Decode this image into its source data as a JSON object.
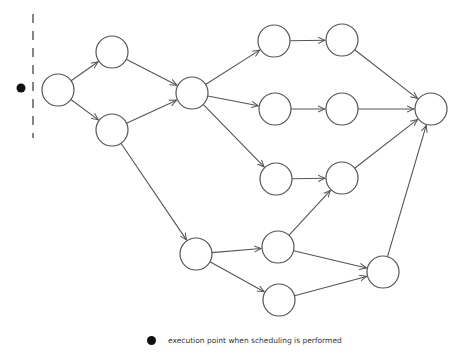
{
  "diagram": {
    "type": "directed-graph",
    "node_radius": 16,
    "nodes": [
      {
        "id": "A",
        "x": 58,
        "y": 90
      },
      {
        "id": "B",
        "x": 112,
        "y": 52
      },
      {
        "id": "C",
        "x": 112,
        "y": 130
      },
      {
        "id": "D",
        "x": 192,
        "y": 93
      },
      {
        "id": "E",
        "x": 274,
        "y": 41
      },
      {
        "id": "F",
        "x": 342,
        "y": 40
      },
      {
        "id": "G",
        "x": 275,
        "y": 109
      },
      {
        "id": "H",
        "x": 342,
        "y": 109
      },
      {
        "id": "I",
        "x": 276,
        "y": 179
      },
      {
        "id": "J",
        "x": 342,
        "y": 178
      },
      {
        "id": "K",
        "x": 431,
        "y": 109
      },
      {
        "id": "L",
        "x": 196,
        "y": 254
      },
      {
        "id": "M",
        "x": 278,
        "y": 247
      },
      {
        "id": "N",
        "x": 279,
        "y": 300
      },
      {
        "id": "O",
        "x": 383,
        "y": 272
      }
    ],
    "edges": [
      [
        "A",
        "B"
      ],
      [
        "A",
        "C"
      ],
      [
        "B",
        "D"
      ],
      [
        "C",
        "D"
      ],
      [
        "C",
        "L"
      ],
      [
        "D",
        "E"
      ],
      [
        "D",
        "G"
      ],
      [
        "D",
        "I"
      ],
      [
        "E",
        "F"
      ],
      [
        "G",
        "H"
      ],
      [
        "I",
        "J"
      ],
      [
        "F",
        "K"
      ],
      [
        "H",
        "K"
      ],
      [
        "J",
        "K"
      ],
      [
        "L",
        "M"
      ],
      [
        "L",
        "N"
      ],
      [
        "M",
        "J"
      ],
      [
        "M",
        "O"
      ],
      [
        "N",
        "O"
      ],
      [
        "O",
        "K"
      ]
    ],
    "scheduling_marker": {
      "x": 21,
      "y": 88
    },
    "divider_line": {
      "x": 33,
      "y1": 14,
      "y2": 138
    }
  },
  "legend": {
    "symbol": "filled-black-circle",
    "label": "execution point when scheduling is performed"
  },
  "colors": {
    "stroke": "#555555",
    "marker": "#111111",
    "background": "#ffffff"
  }
}
